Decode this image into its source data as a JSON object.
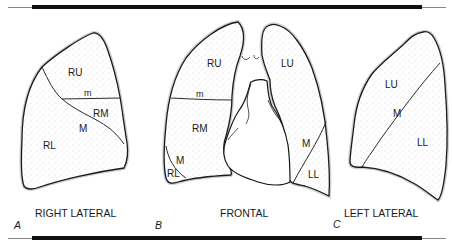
{
  "figure": {
    "rules": {
      "top_thin": {
        "x1": 8,
        "x2": 446,
        "y": 7.5
      },
      "top_thick": {
        "x1": 32,
        "x2": 422,
        "y": 7
      },
      "bottom_thin": {
        "x1": 8,
        "x2": 446,
        "y": 238.5
      },
      "bottom_thick": {
        "x1": 32,
        "x2": 422,
        "y": 238
      }
    },
    "colors": {
      "ink": "#1a1a1a",
      "stipple": "#9a9a9a",
      "background": "#ffffff"
    }
  },
  "panels": [
    {
      "letter": "A",
      "title": "RIGHT LATERAL",
      "labels": {
        "ru": "RU",
        "m_small": "m",
        "rm": "RM",
        "m": "M",
        "rl": "RL"
      }
    },
    {
      "letter": "B",
      "title": "FRONTAL",
      "labels": {
        "ru": "RU",
        "m_small": "m",
        "rm": "RM",
        "m_right": "M",
        "rl": "RL",
        "lu": "LU",
        "m_left": "M",
        "ll": "LL"
      }
    },
    {
      "letter": "C",
      "title": "LEFT LATERAL",
      "labels": {
        "lu": "LU",
        "m": "M",
        "ll": "LL"
      }
    }
  ]
}
